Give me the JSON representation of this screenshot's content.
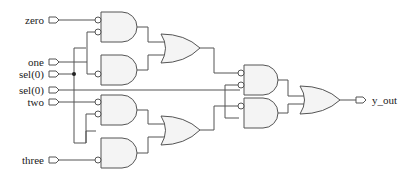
{
  "diagram": {
    "type": "logic-circuit",
    "inputs": [
      {
        "id": "zero",
        "label": "zero"
      },
      {
        "id": "one",
        "label": "one"
      },
      {
        "id": "sel0_a",
        "label": "sel(0)"
      },
      {
        "id": "sel0_b",
        "label": "sel(0)"
      },
      {
        "id": "two",
        "label": "two"
      },
      {
        "id": "three",
        "label": "three"
      }
    ],
    "outputs": [
      {
        "id": "y_out",
        "label": "y_out"
      }
    ],
    "gates": [
      {
        "id": "and1",
        "type": "AND",
        "inverted_inputs": 2
      },
      {
        "id": "and2",
        "type": "AND",
        "inverted_inputs": 1
      },
      {
        "id": "or1",
        "type": "OR"
      },
      {
        "id": "and3",
        "type": "AND",
        "inverted_inputs": 2
      },
      {
        "id": "and4",
        "type": "AND",
        "inverted_inputs": 1
      },
      {
        "id": "or2",
        "type": "OR"
      },
      {
        "id": "and5",
        "type": "AND",
        "inverted_inputs": 2
      },
      {
        "id": "and6",
        "type": "AND",
        "inverted_inputs": 1
      },
      {
        "id": "or3",
        "type": "OR"
      }
    ]
  }
}
